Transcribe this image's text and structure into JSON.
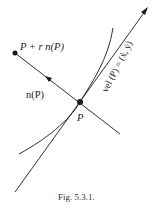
{
  "figure": {
    "caption": "Fig. 5.3.1.",
    "labels": {
      "point_offset": "P + r n(P)",
      "normal": "n(P)",
      "point": "P",
      "velocity": "vel (P) = (ẋ, ẏ)"
    },
    "elements": [
      {
        "type": "curve",
        "name": "trajectory curve"
      },
      {
        "type": "line",
        "name": "tangent line with arrow",
        "direction": "upper-right"
      },
      {
        "type": "line",
        "name": "normal line",
        "direction": "upper-left"
      },
      {
        "type": "point",
        "name": "P"
      },
      {
        "type": "point",
        "name": "P + r n(P)"
      }
    ],
    "colors": {
      "ink": "#1a1a1a",
      "background": "#ffffff"
    }
  }
}
